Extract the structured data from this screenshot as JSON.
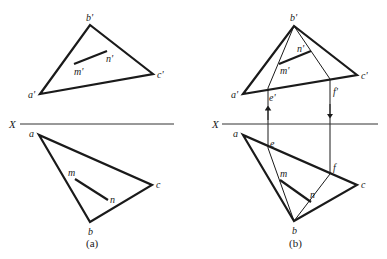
{
  "figures": [
    {
      "id": "a",
      "caption": "(a)",
      "axis_label": "X",
      "elevation": {
        "vertices": {
          "a": "a'",
          "b": "b'",
          "c": "c'"
        },
        "segment": {
          "m": "m'",
          "n": "n'"
        }
      },
      "plan": {
        "vertices": {
          "a": "a",
          "b": "b",
          "c": "c"
        },
        "segment": {
          "m": "m",
          "n": "n"
        }
      }
    },
    {
      "id": "b",
      "caption": "(b)",
      "axis_label": "X",
      "elevation": {
        "vertices": {
          "a": "a'",
          "b": "b'",
          "c": "c'"
        },
        "segment": {
          "m": "m'",
          "n": "n'"
        },
        "aux_points": {
          "e": "e'",
          "f": "f'"
        }
      },
      "plan": {
        "vertices": {
          "a": "a",
          "b": "b",
          "c": "c"
        },
        "segment": {
          "m": "m",
          "n": "n"
        },
        "aux_points": {
          "e": "e",
          "f": "f"
        }
      }
    }
  ]
}
